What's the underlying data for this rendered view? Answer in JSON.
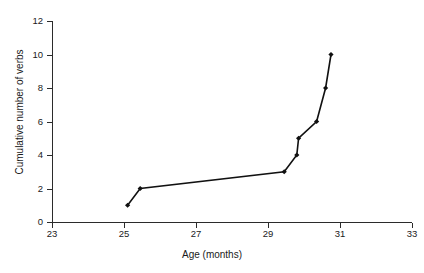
{
  "chart_data": {
    "type": "line",
    "title": "",
    "xlabel": "Age (months)",
    "ylabel": "Cumulative number of verbs",
    "xlim": [
      23,
      33
    ],
    "ylim": [
      0,
      12
    ],
    "xticks": [
      23,
      25,
      27,
      29,
      31,
      33
    ],
    "yticks": [
      0,
      2,
      4,
      6,
      8,
      10,
      12
    ],
    "xtick_labels": [
      "23",
      "25",
      "27",
      "29",
      "31",
      "33"
    ],
    "ytick_labels": [
      "0",
      "2",
      "4",
      "6",
      "8",
      "10",
      "12"
    ],
    "grid": false,
    "legend": null,
    "series": [
      {
        "name": "cumulative verbs",
        "marker": "filled-diamond",
        "color": "#111111",
        "x": [
          25.1,
          25.45,
          29.45,
          29.8,
          29.85,
          30.35,
          30.6,
          30.75
        ],
        "y": [
          1,
          2,
          3,
          4,
          5,
          6,
          8,
          10
        ]
      }
    ],
    "points": [
      {
        "age": 25.1,
        "verbs": 1
      },
      {
        "age": 25.45,
        "verbs": 2
      },
      {
        "age": 29.45,
        "verbs": 3
      },
      {
        "age": 29.8,
        "verbs": 4
      },
      {
        "age": 29.85,
        "verbs": 5
      },
      {
        "age": 30.35,
        "verbs": 6
      },
      {
        "age": 30.6,
        "verbs": 8
      },
      {
        "age": 30.75,
        "verbs": 10
      }
    ]
  },
  "axes": {
    "x_label": "Age (months)",
    "y_label": "Cumulative number of verbs",
    "x_ticks": [
      "23",
      "25",
      "27",
      "29",
      "31",
      "33"
    ],
    "y_ticks": [
      "0",
      "2",
      "4",
      "6",
      "8",
      "10",
      "12"
    ],
    "axis_color": "#2b2b2b"
  },
  "style": {
    "background": "#ffffff",
    "line_color": "#111111",
    "marker_color": "#111111"
  }
}
